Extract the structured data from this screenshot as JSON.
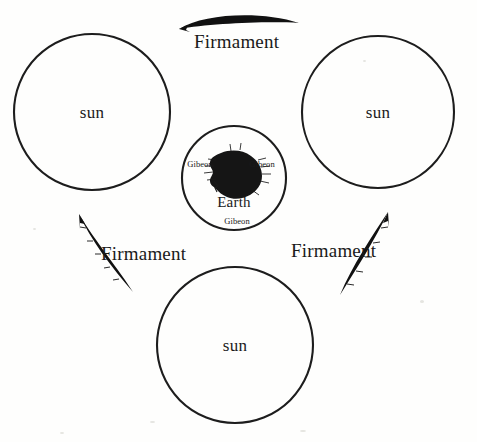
{
  "figure": {
    "type": "cosmological-diagram",
    "background_color": "#fefefd",
    "ink_color": "#1a1a1a",
    "width": 477,
    "height": 442
  },
  "bodies": [
    {
      "id": "sun-top-left",
      "label": "sun",
      "shape": "circle",
      "cx": 92,
      "cy": 112,
      "r": 78
    },
    {
      "id": "sun-top-right",
      "label": "sun",
      "shape": "circle",
      "cx": 378,
      "cy": 112,
      "r": 76
    },
    {
      "id": "sun-bottom",
      "label": "sun",
      "shape": "circle",
      "cx": 235,
      "cy": 345,
      "r": 78
    },
    {
      "id": "earth-sphere",
      "label": "Earth",
      "shape": "circle",
      "cx": 234,
      "cy": 178,
      "r": 52
    }
  ],
  "earth": {
    "label": "Earth",
    "label_x": 234,
    "label_y": 202,
    "blob_fill": "#161616",
    "gibeon_markers": [
      {
        "label": "Gibeon",
        "x": 200,
        "y": 164
      },
      {
        "label": "Gibeon",
        "x": 262,
        "y": 164
      },
      {
        "label": "Gibeon",
        "x": 237,
        "y": 221
      }
    ]
  },
  "firmaments": [
    {
      "id": "firmament-top",
      "label": "Firmament",
      "label_x": 194,
      "label_y": 32,
      "arrow_direction": "left",
      "fill": "#111111"
    },
    {
      "id": "firmament-lower-left",
      "label": "Firmament",
      "label_x": 101,
      "label_y": 244,
      "arrow_direction": "up-right",
      "fill": "#111111"
    },
    {
      "id": "firmament-lower-right",
      "label": "Firmament",
      "label_x": 291,
      "label_y": 241,
      "arrow_direction": "up-right",
      "fill": "#111111"
    }
  ]
}
